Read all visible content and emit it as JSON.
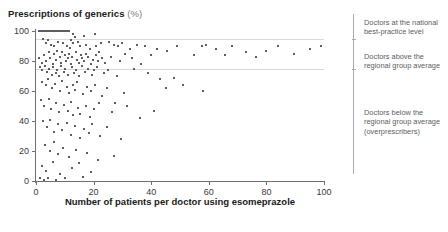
{
  "title": {
    "main": "Prescriptions of generics",
    "unit": "(%)"
  },
  "annotations": [
    {
      "id": "best-practice",
      "text": "Doctors at the national best-practice level",
      "top": 18
    },
    {
      "id": "above-average",
      "text": "Doctors above the regional group average",
      "top": 52
    },
    {
      "id": "below-average",
      "text": "Doctors below the regional group average (overprescribers)",
      "top": 108
    }
  ],
  "chart_data": {
    "type": "scatter",
    "title": "Prescriptions of generics (%)",
    "xlabel": "Number of patients per doctor using esomeprazole",
    "ylabel": "Prescriptions of generics (%)",
    "xlim": [
      0,
      100
    ],
    "ylim": [
      0,
      100
    ],
    "xticks": [
      0,
      20,
      40,
      60,
      80,
      100
    ],
    "yticks": [
      0,
      20,
      40,
      60,
      80,
      100
    ],
    "grid": false,
    "legend": "none",
    "reference_lines": [
      {
        "name": "national best-practice level",
        "y": 95
      },
      {
        "name": "regional group average",
        "y": 75
      }
    ],
    "points": [
      [
        1.2,
        100
      ],
      [
        1.9,
        100
      ],
      [
        2.4,
        100
      ],
      [
        3.0,
        100
      ],
      [
        3.6,
        100
      ],
      [
        4.2,
        100
      ],
      [
        4.8,
        100
      ],
      [
        5.4,
        100
      ],
      [
        6.0,
        100
      ],
      [
        6.6,
        100
      ],
      [
        7.2,
        100
      ],
      [
        7.8,
        100
      ],
      [
        8.4,
        100
      ],
      [
        9.0,
        100
      ],
      [
        9.6,
        100
      ],
      [
        10.2,
        100
      ],
      [
        10.8,
        100
      ],
      [
        11.4,
        100
      ],
      [
        13.0,
        98
      ],
      [
        16.5,
        97
      ],
      [
        20.5,
        98
      ],
      [
        2.6,
        95
      ],
      [
        4.1,
        94
      ],
      [
        7.6,
        93
      ],
      [
        12.2,
        94
      ],
      [
        13.0,
        92
      ],
      [
        13.4,
        96
      ],
      [
        14.6,
        93
      ],
      [
        17.5,
        91
      ],
      [
        22.5,
        92
      ],
      [
        3.3,
        92
      ],
      [
        5.2,
        91
      ],
      [
        6.4,
        90
      ],
      [
        9.4,
        92
      ],
      [
        10.6,
        90
      ],
      [
        11.8,
        89
      ],
      [
        15.2,
        90
      ],
      [
        18.6,
        88
      ],
      [
        21.0,
        90
      ],
      [
        25.5,
        93
      ],
      [
        27.0,
        91
      ],
      [
        28.5,
        90
      ],
      [
        30.0,
        92
      ],
      [
        32.5,
        88
      ],
      [
        35.0,
        91
      ],
      [
        38.0,
        90
      ],
      [
        42.0,
        88
      ],
      [
        45.5,
        87
      ],
      [
        49.0,
        90
      ],
      [
        55.0,
        84
      ],
      [
        57.5,
        90
      ],
      [
        59.0,
        91
      ],
      [
        62.5,
        88
      ],
      [
        65.5,
        84
      ],
      [
        68.0,
        90
      ],
      [
        73.0,
        86
      ],
      [
        76.5,
        83
      ],
      [
        80.0,
        87
      ],
      [
        84.0,
        90
      ],
      [
        89.5,
        85
      ],
      [
        95.0,
        88
      ],
      [
        99.0,
        90
      ],
      [
        1.0,
        82
      ],
      [
        2.0,
        79
      ],
      [
        2.8,
        84
      ],
      [
        3.5,
        80
      ],
      [
        4.4,
        86
      ],
      [
        5.0,
        82
      ],
      [
        5.8,
        78
      ],
      [
        6.2,
        85
      ],
      [
        7.0,
        81
      ],
      [
        7.4,
        87
      ],
      [
        8.2,
        83
      ],
      [
        8.8,
        79
      ],
      [
        9.2,
        86
      ],
      [
        10.0,
        84
      ],
      [
        10.4,
        80
      ],
      [
        11.0,
        82
      ],
      [
        11.6,
        85
      ],
      [
        12.0,
        78
      ],
      [
        12.6,
        83
      ],
      [
        13.8,
        86
      ],
      [
        14.2,
        81
      ],
      [
        14.8,
        79
      ],
      [
        15.6,
        84
      ],
      [
        16.0,
        82
      ],
      [
        16.8,
        80
      ],
      [
        17.2,
        85
      ],
      [
        18.0,
        83
      ],
      [
        19.0,
        78
      ],
      [
        19.8,
        81
      ],
      [
        20.8,
        84
      ],
      [
        21.6,
        80
      ],
      [
        22.0,
        86
      ],
      [
        23.0,
        82
      ],
      [
        24.0,
        79
      ],
      [
        26.0,
        83
      ],
      [
        29.0,
        80
      ],
      [
        31.0,
        85
      ],
      [
        33.5,
        82
      ],
      [
        36.5,
        78
      ],
      [
        40.0,
        84
      ],
      [
        1.5,
        76
      ],
      [
        2.2,
        74
      ],
      [
        3.1,
        77
      ],
      [
        3.9,
        73
      ],
      [
        4.6,
        75
      ],
      [
        5.5,
        71
      ],
      [
        6.0,
        76
      ],
      [
        6.8,
        72
      ],
      [
        7.2,
        74
      ],
      [
        8.0,
        70
      ],
      [
        8.6,
        77
      ],
      [
        9.8,
        73
      ],
      [
        10.2,
        75
      ],
      [
        11.2,
        71
      ],
      [
        12.4,
        76
      ],
      [
        13.2,
        72
      ],
      [
        14.0,
        74
      ],
      [
        15.0,
        70
      ],
      [
        15.8,
        77
      ],
      [
        17.0,
        73
      ],
      [
        18.2,
        75
      ],
      [
        19.4,
        71
      ],
      [
        20.2,
        74
      ],
      [
        21.2,
        76
      ],
      [
        23.5,
        72
      ],
      [
        25.0,
        74
      ],
      [
        28.0,
        70
      ],
      [
        34.0,
        75
      ],
      [
        39.0,
        72
      ],
      [
        43.0,
        68
      ],
      [
        48.0,
        69
      ],
      [
        2.0,
        66
      ],
      [
        3.4,
        64
      ],
      [
        4.0,
        68
      ],
      [
        5.6,
        62
      ],
      [
        6.6,
        65
      ],
      [
        8.4,
        60
      ],
      [
        9.0,
        67
      ],
      [
        10.6,
        63
      ],
      [
        11.4,
        59
      ],
      [
        12.8,
        64
      ],
      [
        13.6,
        61
      ],
      [
        14.4,
        66
      ],
      [
        16.2,
        58
      ],
      [
        17.8,
        63
      ],
      [
        19.0,
        60
      ],
      [
        20.6,
        64
      ],
      [
        22.8,
        57
      ],
      [
        24.5,
        62
      ],
      [
        27.5,
        52
      ],
      [
        30.5,
        59
      ],
      [
        45.0,
        62
      ],
      [
        51.0,
        64
      ],
      [
        58.0,
        60
      ],
      [
        1.8,
        54
      ],
      [
        2.9,
        50
      ],
      [
        4.5,
        55
      ],
      [
        5.2,
        48
      ],
      [
        6.8,
        52
      ],
      [
        8.0,
        46
      ],
      [
        9.6,
        51
      ],
      [
        11.0,
        47
      ],
      [
        12.2,
        53
      ],
      [
        13.0,
        44
      ],
      [
        14.6,
        49
      ],
      [
        15.4,
        45
      ],
      [
        17.2,
        50
      ],
      [
        18.8,
        43
      ],
      [
        20.0,
        48
      ],
      [
        21.8,
        52
      ],
      [
        26.5,
        46
      ],
      [
        31.5,
        50
      ],
      [
        36.0,
        42
      ],
      [
        41.0,
        47
      ],
      [
        2.5,
        40
      ],
      [
        3.8,
        36
      ],
      [
        5.0,
        41
      ],
      [
        6.4,
        33
      ],
      [
        7.8,
        38
      ],
      [
        9.2,
        34
      ],
      [
        10.8,
        39
      ],
      [
        12.0,
        31
      ],
      [
        13.4,
        37
      ],
      [
        15.2,
        29
      ],
      [
        16.6,
        35
      ],
      [
        18.4,
        32
      ],
      [
        19.6,
        38
      ],
      [
        22.2,
        30
      ],
      [
        24.8,
        36
      ],
      [
        29.5,
        28
      ],
      [
        3.2,
        24
      ],
      [
        4.8,
        20
      ],
      [
        6.2,
        26
      ],
      [
        7.6,
        18
      ],
      [
        9.4,
        22
      ],
      [
        11.6,
        16
      ],
      [
        13.8,
        21
      ],
      [
        15.0,
        12
      ],
      [
        17.6,
        19
      ],
      [
        21.4,
        14
      ],
      [
        27.0,
        17
      ],
      [
        2.1,
        10
      ],
      [
        3.6,
        7
      ],
      [
        5.8,
        13
      ],
      [
        8.2,
        5
      ],
      [
        12.6,
        9
      ],
      [
        16.4,
        3
      ],
      [
        19.2,
        6
      ],
      [
        1.4,
        2
      ],
      [
        2.7,
        1
      ],
      [
        4.3,
        2
      ],
      [
        6.9,
        1
      ],
      [
        10.0,
        2
      ]
    ]
  }
}
